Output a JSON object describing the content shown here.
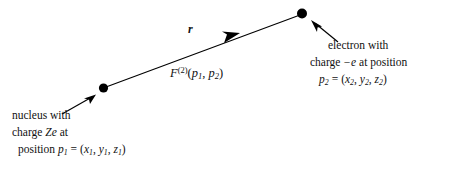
{
  "figure": {
    "kind": "physics-diagram",
    "background_color": "#ffffff",
    "ink_color": "#000000",
    "vector_label": "r",
    "force_label": {
      "symbol": "F",
      "superscript": "(2)",
      "arguments_open": "(",
      "arg1_base": "p",
      "arg1_sub": "1",
      "comma": ", ",
      "arg2_base": "p",
      "arg2_sub": "2",
      "arguments_close": ")",
      "full_text": "F(2)(p1, p2)"
    },
    "nucleus": {
      "dot_name": "nucleus-dot",
      "caption_line1": "nucleus with",
      "caption_line2_prefix": "charge ",
      "caption_line2_symbol": "Ze",
      "caption_line2_suffix": " at",
      "caption_line3_prefix": "position ",
      "caption_line3_point_base": "p",
      "caption_line3_point_sub": "1",
      "caption_line3_equals": "=",
      "caption_line3_open": "(",
      "caption_line3_x_base": "x",
      "caption_line3_x_sub": "1",
      "caption_line3_comma1": ", ",
      "caption_line3_y_base": "y",
      "caption_line3_y_sub": "1",
      "caption_line3_comma2": ", ",
      "caption_line3_z_base": "z",
      "caption_line3_z_sub": "1",
      "caption_line3_close": ")"
    },
    "electron": {
      "dot_name": "electron-dot",
      "caption_line1": "electron with",
      "caption_line2_prefix": "charge ",
      "caption_line2_symbol": "−e",
      "caption_line2_suffix": " at position",
      "caption_line3_point_base": "p",
      "caption_line3_point_sub": "2",
      "caption_line3_equals": "=",
      "caption_line3_open": "(",
      "caption_line3_x_base": "x",
      "caption_line3_x_sub": "2",
      "caption_line3_comma1": ", ",
      "caption_line3_y_base": "y",
      "caption_line3_y_sub": "2",
      "caption_line3_comma2": ", ",
      "caption_line3_z_base": "z",
      "caption_line3_z_sub": "2",
      "caption_line3_close": ")"
    }
  }
}
